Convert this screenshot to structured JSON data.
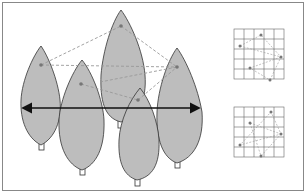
{
  "diagram": {
    "title": "",
    "colors": {
      "leaf_fill": "#bdbdbd",
      "leaf_stroke": "#333333",
      "dashed_line": "#999999",
      "arrow": "#111111",
      "grid": "#666666",
      "frame": "#888888"
    },
    "trees": [
      {
        "id": "tree-1",
        "cx": 41,
        "top": 46,
        "bottom": 145
      },
      {
        "id": "tree-2",
        "cx": 82,
        "top": 60,
        "bottom": 170
      },
      {
        "id": "tree-3",
        "cx": 121,
        "top": 10,
        "bottom": 122
      },
      {
        "id": "tree-4",
        "cx": 140,
        "top": 88,
        "bottom": 180
      },
      {
        "id": "tree-5",
        "cx": 177,
        "top": 48,
        "bottom": 163
      }
    ],
    "points": [
      {
        "id": "p1",
        "x": 41,
        "y": 65
      },
      {
        "id": "p2",
        "x": 81,
        "y": 84
      },
      {
        "id": "p3",
        "x": 121,
        "y": 26
      },
      {
        "id": "p4",
        "x": 138,
        "y": 100
      },
      {
        "id": "p5",
        "x": 177,
        "y": 67
      }
    ],
    "arrow": {
      "x1": 22,
      "x2": 200,
      "y": 108,
      "type": "double-headed"
    },
    "insets": [
      {
        "id": "grid-top",
        "rows": 5,
        "cols": 5,
        "x": 234,
        "y": 29,
        "cell": 10
      },
      {
        "id": "grid-bottom",
        "rows": 5,
        "cols": 5,
        "x": 234,
        "y": 107,
        "cell": 10
      }
    ]
  }
}
